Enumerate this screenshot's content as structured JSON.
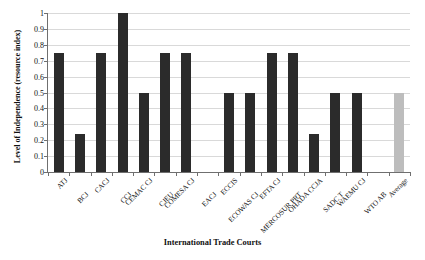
{
  "chart_data": {
    "type": "bar",
    "title": "",
    "xlabel": "International Trade Courts",
    "ylabel": "Level of Independence (resource index)",
    "ylim": [
      0,
      1
    ],
    "ytick_labels": [
      "1",
      "0.9",
      "0.8",
      "0.7",
      "0.6",
      "0.5",
      "0.4",
      "0.3",
      "0.2",
      "0.1",
      "0"
    ],
    "ytick_values": [
      1,
      0.9,
      0.8,
      0.7,
      0.6,
      0.5,
      0.4,
      0.3,
      0.2,
      0.1,
      0
    ],
    "grid": true,
    "legend": "none",
    "categories": [
      "ATJ",
      "BCJ",
      "CACJ",
      "CCJ",
      "CEMAC CJ",
      "CJEU",
      "COMESA CJ",
      "EACJ",
      "ECCIS",
      "ECOWAS CJ",
      "EFTA CJ",
      "MERCOSUR PRT",
      "OHADA CCJA",
      "SADC T",
      "WAEMU CJ",
      "WTO AB",
      "Average"
    ],
    "values": [
      0.75,
      0.24,
      0.75,
      1.0,
      0.5,
      0.75,
      0.75,
      0,
      0.5,
      0.5,
      0.75,
      0.75,
      0.24,
      0.5,
      0.5,
      0,
      0.5
    ],
    "bar_colors": [
      "#2b2b2b",
      "#2b2b2b",
      "#2b2b2b",
      "#2b2b2b",
      "#2b2b2b",
      "#2b2b2b",
      "#2b2b2b",
      "#2b2b2b",
      "#2b2b2b",
      "#2b2b2b",
      "#2b2b2b",
      "#2b2b2b",
      "#2b2b2b",
      "#2b2b2b",
      "#2b2b2b",
      "#2b2b2b",
      "#bdbdbd"
    ],
    "series_color": "#2b2b2b",
    "average_color": "#bdbdbd",
    "gridline_color": "#d9d9d9",
    "axis_color": "#6f6f6f"
  }
}
